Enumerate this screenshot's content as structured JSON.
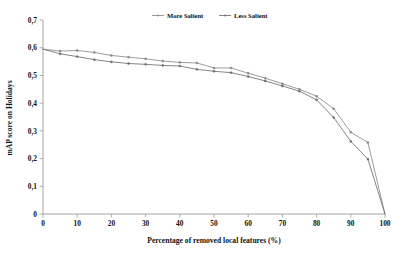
{
  "chart_data": {
    "type": "line",
    "title": "",
    "xlabel": "Percentage of removed local features (%)",
    "ylabel": "mAP score on Holidays",
    "xlim": [
      0,
      100
    ],
    "ylim": [
      0,
      0.7
    ],
    "grid": false,
    "legend_position": "top-center",
    "xticks": [
      "0",
      "10",
      "20",
      "30",
      "40",
      "50",
      "60",
      "70",
      "80",
      "90",
      "100"
    ],
    "xtick_values": [
      0,
      10,
      20,
      30,
      40,
      50,
      60,
      70,
      80,
      90,
      100
    ],
    "yticks": [
      "0",
      "0,1",
      "0,2",
      "0,3",
      "0,4",
      "0,5",
      "0,6",
      "0,7"
    ],
    "ytick_values": [
      0,
      0.1,
      0.2,
      0.3,
      0.4,
      0.5,
      0.6,
      0.7
    ],
    "decimal_separator": ",",
    "x": [
      0,
      5,
      10,
      15,
      20,
      25,
      30,
      35,
      40,
      45,
      50,
      55,
      60,
      65,
      70,
      75,
      80,
      85,
      90,
      95,
      100
    ],
    "series": [
      {
        "name": "More Salient",
        "color": "#8a8a8a",
        "marker": "point",
        "values": [
          0.595,
          0.588,
          0.59,
          0.583,
          0.572,
          0.566,
          0.56,
          0.552,
          0.547,
          0.545,
          0.527,
          0.527,
          0.508,
          0.49,
          0.47,
          0.45,
          0.425,
          0.38,
          0.295,
          0.258,
          0.0
        ]
      },
      {
        "name": "Less Salient",
        "color": "#6f6f6f",
        "marker": "point",
        "values": [
          0.595,
          0.578,
          0.568,
          0.557,
          0.549,
          0.543,
          0.54,
          0.536,
          0.534,
          0.522,
          0.515,
          0.51,
          0.496,
          0.48,
          0.462,
          0.443,
          0.412,
          0.348,
          0.262,
          0.198,
          0.0
        ]
      }
    ]
  },
  "legend": {
    "items": [
      {
        "label": "More Salient"
      },
      {
        "label": "Less Salient"
      }
    ]
  },
  "axes": {
    "x_title": "Percentage of removed local features (%)",
    "y_title": "mAP score on Holidays"
  }
}
